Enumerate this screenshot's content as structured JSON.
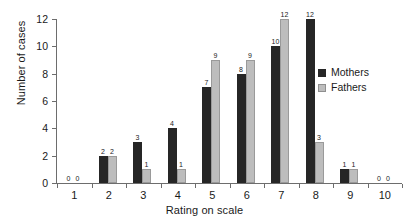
{
  "chart_data": {
    "type": "bar",
    "title": "",
    "xlabel": "Rating on scale",
    "ylabel": "Number of cases",
    "categories": [
      "1",
      "2",
      "3",
      "4",
      "5",
      "6",
      "7",
      "8",
      "9",
      "10"
    ],
    "series": [
      {
        "name": "Mothers",
        "color": "#262626",
        "values": [
          0,
          2,
          3,
          4,
          7,
          8,
          10,
          12,
          1,
          0
        ]
      },
      {
        "name": "Fathers",
        "color": "#bdbdbd",
        "values": [
          0,
          2,
          1,
          1,
          9,
          9,
          12,
          3,
          1,
          0
        ]
      }
    ],
    "ylim": [
      0,
      12
    ],
    "yticks": [
      "0",
      "2",
      "4",
      "6",
      "8",
      "10",
      "12"
    ],
    "grid": false,
    "legend_position": "right",
    "data_labels": true
  },
  "legend": {
    "items": [
      {
        "label": "Mothers"
      },
      {
        "label": "Fathers"
      }
    ]
  }
}
